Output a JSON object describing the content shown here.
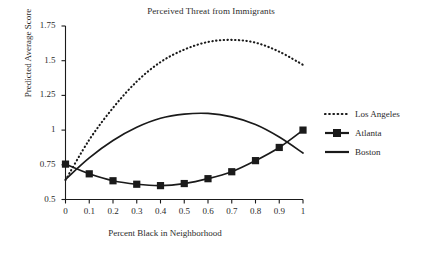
{
  "chart_data": {
    "type": "line",
    "title": "Perceived Threat from Immigrants",
    "xlabel": "Percent Black in Neighborhood",
    "ylabel": "Predicted Average Score",
    "xlim": [
      0,
      1
    ],
    "ylim": [
      0.5,
      1.75
    ],
    "grid": false,
    "legend_position": "right",
    "xticks": [
      "0",
      "0.1",
      "0.2",
      "0.3",
      "0.4",
      "0.5",
      "0.6",
      "0.7",
      "0.8",
      "0.9",
      "1"
    ],
    "xtick_values": [
      0,
      0.1,
      0.2,
      0.3,
      0.4,
      0.5,
      0.6,
      0.7,
      0.8,
      0.9,
      1
    ],
    "yticks": [
      "0.5",
      "0.75",
      "1",
      "1.25",
      "1.5",
      "1.75"
    ],
    "ytick_values": [
      0.5,
      0.75,
      1,
      1.25,
      1.5,
      1.75
    ],
    "x": [
      0,
      0.1,
      0.2,
      0.3,
      0.4,
      0.5,
      0.6,
      0.7,
      0.8,
      0.9,
      1
    ],
    "series": [
      {
        "name": "Los Angeles",
        "style": "dotted",
        "marker": "none",
        "color": "#1a1a1a",
        "values": [
          0.64,
          0.93,
          1.16,
          1.35,
          1.49,
          1.58,
          1.635,
          1.65,
          1.63,
          1.565,
          1.47
        ]
      },
      {
        "name": "Atlanta",
        "style": "solid",
        "marker": "square",
        "color": "#1a1a1a",
        "values": [
          0.755,
          0.685,
          0.635,
          0.61,
          0.6,
          0.615,
          0.65,
          0.7,
          0.78,
          0.875,
          1.0
        ]
      },
      {
        "name": "Boston",
        "style": "solid",
        "marker": "none",
        "color": "#1a1a1a",
        "values": [
          0.645,
          0.8,
          0.925,
          1.02,
          1.085,
          1.115,
          1.12,
          1.095,
          1.04,
          0.95,
          0.835
        ]
      }
    ]
  },
  "legend": {
    "items": [
      {
        "label": "Los Angeles",
        "key": "dotted-line-key"
      },
      {
        "label": "Atlanta",
        "key": "square-marker-line-key"
      },
      {
        "label": "Boston",
        "key": "solid-line-key"
      }
    ]
  }
}
